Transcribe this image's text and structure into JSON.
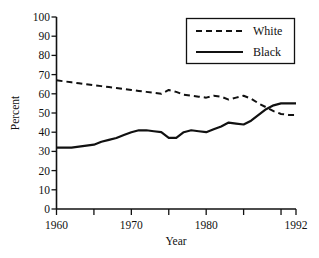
{
  "chart_data": {
    "type": "line",
    "title": "",
    "xlabel": "Year",
    "ylabel": "Percent",
    "xlim": [
      1960,
      1992
    ],
    "ylim": [
      0,
      100
    ],
    "grid": false,
    "legend_position": "top-right",
    "y_ticks": [
      0,
      10,
      20,
      30,
      40,
      50,
      60,
      70,
      80,
      90,
      100
    ],
    "y_tick_labels": [
      "0",
      "10",
      "20",
      "30",
      "40",
      "50",
      "60",
      "70",
      "80",
      "90",
      "100"
    ],
    "x_ticks": [
      1960,
      1965,
      1970,
      1975,
      1980,
      1985,
      1990,
      1992
    ],
    "x_tick_labels": [
      "1960",
      "",
      "1970",
      "",
      "1980",
      "",
      "",
      "1992"
    ],
    "x_labeled_ticks": [
      {
        "value": 1960,
        "label": "1960"
      },
      {
        "value": 1970,
        "label": "1970"
      },
      {
        "value": 1980,
        "label": "1980"
      },
      {
        "value": 1992,
        "label": "1992"
      }
    ],
    "x": [
      1960,
      1961,
      1962,
      1963,
      1964,
      1965,
      1966,
      1967,
      1968,
      1969,
      1970,
      1971,
      1972,
      1973,
      1974,
      1975,
      1976,
      1977,
      1978,
      1979,
      1980,
      1981,
      1982,
      1983,
      1984,
      1985,
      1986,
      1987,
      1988,
      1989,
      1990,
      1991,
      1992
    ],
    "series": [
      {
        "name": "White",
        "style": "dashed",
        "color": "#111111",
        "values": [
          67,
          66.5,
          66,
          65.5,
          65,
          64.5,
          64,
          63.5,
          63,
          62.5,
          62,
          61.5,
          61,
          60.5,
          60,
          62,
          61,
          59.5,
          59,
          58.5,
          58,
          59,
          58.5,
          57,
          58,
          59,
          57.5,
          55,
          53,
          51,
          49.5,
          49,
          49
        ]
      },
      {
        "name": "Black",
        "style": "solid",
        "color": "#111111",
        "values": [
          32,
          32,
          32,
          32.5,
          33,
          33.5,
          35,
          36,
          37,
          38.5,
          40,
          41,
          41,
          40.5,
          40,
          37,
          37,
          40,
          41,
          40.5,
          40,
          41.5,
          43,
          45,
          44.5,
          44,
          46,
          49,
          52,
          54,
          55,
          55,
          55
        ]
      }
    ],
    "legend": [
      {
        "label": "White",
        "style": "dashed"
      },
      {
        "label": "Black",
        "style": "solid"
      }
    ]
  }
}
